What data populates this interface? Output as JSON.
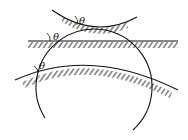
{
  "diagram": {
    "labels": {
      "theta_top": "θ",
      "theta_middle": "θ",
      "theta_bottom": "θ"
    },
    "colors": {
      "stroke": "#111111",
      "background": "#ffffff"
    }
  }
}
